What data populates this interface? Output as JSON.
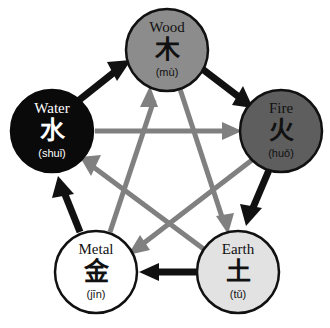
{
  "diagram": {
    "background_color": "#ffffff",
    "generating_cycle_color": "#111111",
    "overcoming_cycle_color": "#808080",
    "nodes": [
      {
        "id": "wood",
        "name_en": "Wood",
        "hanzi": "木",
        "pinyin": "(mù)",
        "fill": "#8c8c8c",
        "stroke": "#111111",
        "text_color": "#111111",
        "cx": 167,
        "cy": 50,
        "r": 41
      },
      {
        "id": "fire",
        "name_en": "Fire",
        "hanzi": "火",
        "pinyin": "(huǒ)",
        "fill": "#5e5e5e",
        "stroke": "#111111",
        "text_color": "#111111",
        "cx": 281,
        "cy": 131,
        "r": 41
      },
      {
        "id": "earth",
        "name_en": "Earth",
        "hanzi": "土",
        "pinyin": "(tǔ)",
        "fill": "#e2e2e2",
        "stroke": "#111111",
        "text_color": "#111111",
        "cx": 238,
        "cy": 272,
        "r": 41
      },
      {
        "id": "metal",
        "name_en": "Metal",
        "hanzi": "金",
        "pinyin": "(jīn)",
        "fill": "#ffffff",
        "stroke": "#111111",
        "text_color": "#111111",
        "cx": 96,
        "cy": 272,
        "r": 41
      },
      {
        "id": "water",
        "name_en": "Water",
        "hanzi": "水",
        "pinyin": "(shuǐ)",
        "fill": "#0a0a0a",
        "stroke": "#0a0a0a",
        "text_color": "#ffffff",
        "cx": 52,
        "cy": 131,
        "r": 41
      }
    ],
    "generating_edges": [
      {
        "id": "water-to-wood",
        "from": "water",
        "to": "wood",
        "label": "Water generates Wood"
      },
      {
        "id": "wood-to-fire",
        "from": "wood",
        "to": "fire",
        "label": "Wood generates Fire"
      },
      {
        "id": "fire-to-earth",
        "from": "fire",
        "to": "earth",
        "label": "Fire generates Earth"
      },
      {
        "id": "earth-to-metal",
        "from": "earth",
        "to": "metal",
        "label": "Earth generates Metal"
      },
      {
        "id": "metal-to-water",
        "from": "metal",
        "to": "water",
        "label": "Metal generates Water"
      }
    ],
    "overcoming_edges": [
      {
        "id": "water-to-fire",
        "from": "water",
        "to": "fire",
        "label": "Water overcomes Fire"
      },
      {
        "id": "fire-to-metal",
        "from": "fire",
        "to": "metal",
        "label": "Fire overcomes Metal"
      },
      {
        "id": "metal-to-wood",
        "from": "metal",
        "to": "wood",
        "label": "Metal overcomes Wood"
      },
      {
        "id": "wood-to-earth",
        "from": "wood",
        "to": "earth",
        "label": "Wood overcomes Earth"
      },
      {
        "id": "earth-to-water",
        "from": "earth",
        "to": "water",
        "label": "Earth overcomes Water"
      }
    ]
  }
}
